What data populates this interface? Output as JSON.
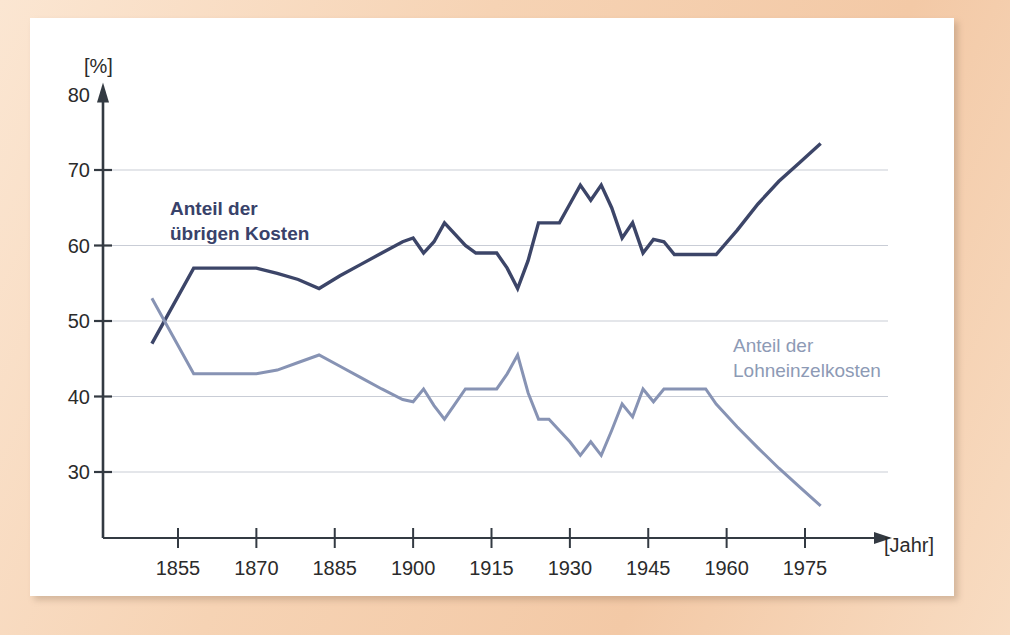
{
  "figure": {
    "background_mat_color": "#f5d2b3",
    "plate_color": "#ffffff"
  },
  "chart_data": {
    "type": "line",
    "title": "",
    "subtitle": "",
    "xlabel": "[Jahr]",
    "ylabel": "[%]",
    "xlim": [
      1848,
      1982
    ],
    "ylim": [
      22,
      80
    ],
    "grid": true,
    "grid_color": "#c9cdd6",
    "legend_position": "inline-annotations",
    "x_ticks": [
      1855,
      1870,
      1885,
      1900,
      1915,
      1930,
      1945,
      1960,
      1975
    ],
    "x_tick_labels": [
      "1855",
      "1870",
      "1885",
      "1900",
      "1915",
      "1930",
      "1945",
      "1960",
      "1975"
    ],
    "y_ticks": [
      30,
      40,
      50,
      60,
      70,
      80
    ],
    "y_tick_labels": [
      "30",
      "40",
      "50",
      "60",
      "70",
      "80"
    ],
    "series": [
      {
        "name": "Anteil der übrigen Kosten",
        "label_text": "Anteil der\nübrigen Kosten",
        "color": "#3c4568",
        "line_width": 3.4,
        "label_x": 1860,
        "label_y": 64,
        "x": [
          1850,
          1858,
          1862,
          1866,
          1870,
          1874,
          1878,
          1882,
          1886,
          1890,
          1894,
          1898,
          1900,
          1902,
          1904,
          1906,
          1908,
          1910,
          1912,
          1914,
          1916,
          1918,
          1920,
          1922,
          1924,
          1926,
          1928,
          1930,
          1932,
          1934,
          1936,
          1938,
          1940,
          1942,
          1944,
          1946,
          1948,
          1950,
          1952,
          1954,
          1956,
          1958,
          1962,
          1966,
          1970,
          1974,
          1978
        ],
        "y": [
          47.0,
          57.0,
          57.0,
          57.0,
          57.0,
          56.3,
          55.5,
          54.3,
          56.0,
          57.5,
          59.0,
          60.5,
          61.0,
          59.0,
          60.5,
          63.0,
          61.5,
          60.0,
          59.0,
          59.0,
          59.0,
          57.0,
          54.3,
          58.0,
          63.0,
          63.0,
          63.0,
          65.5,
          68.0,
          66.0,
          68.0,
          65.0,
          61.0,
          63.0,
          59.0,
          60.8,
          60.5,
          58.8,
          58.8,
          58.8,
          58.8,
          58.8,
          62.0,
          65.5,
          68.5,
          71.0,
          73.5
        ]
      },
      {
        "name": "Anteil der Lohneinzelkosten",
        "label_text": "Anteil der\nLohneinzelkosten",
        "color": "#8793b4",
        "line_width": 3.0,
        "label_x": 1966,
        "label_y": 45,
        "x": [
          1850,
          1858,
          1862,
          1866,
          1870,
          1874,
          1878,
          1882,
          1886,
          1890,
          1894,
          1898,
          1900,
          1902,
          1904,
          1906,
          1908,
          1910,
          1912,
          1914,
          1916,
          1918,
          1920,
          1922,
          1924,
          1926,
          1928,
          1930,
          1932,
          1934,
          1936,
          1938,
          1940,
          1942,
          1944,
          1946,
          1948,
          1950,
          1952,
          1954,
          1956,
          1958,
          1962,
          1966,
          1970,
          1974,
          1978
        ],
        "y": [
          53.0,
          43.0,
          43.0,
          43.0,
          43.0,
          43.5,
          44.5,
          45.5,
          44.0,
          42.5,
          41.0,
          39.6,
          39.3,
          41.0,
          38.8,
          37.0,
          39.0,
          41.0,
          41.0,
          41.0,
          41.0,
          43.0,
          45.5,
          40.5,
          37.0,
          37.0,
          35.5,
          34.0,
          32.2,
          34.0,
          32.2,
          35.5,
          39.0,
          37.3,
          41.0,
          39.3,
          41.0,
          41.0,
          41.0,
          41.0,
          41.0,
          39.0,
          36.0,
          33.2,
          30.5,
          28.0,
          25.5
        ]
      }
    ]
  }
}
